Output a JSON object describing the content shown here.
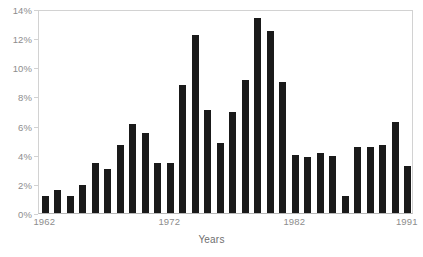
{
  "chart_data": {
    "type": "bar",
    "title": "",
    "subtitle": "",
    "xlabel": "Years",
    "ylabel": "",
    "categories": [
      "1962",
      "1963",
      "1964",
      "1965",
      "1966",
      "1967",
      "1968",
      "1969",
      "1970",
      "1971",
      "1972",
      "1973",
      "1974",
      "1975",
      "1976",
      "1977",
      "1978",
      "1979",
      "1980",
      "1981",
      "1982",
      "1983",
      "1984",
      "1985",
      "1986",
      "1987",
      "1988",
      "1989",
      "1990",
      "1991"
    ],
    "values": [
      1.2,
      1.6,
      1.2,
      1.9,
      3.4,
      3.0,
      4.7,
      6.1,
      5.5,
      3.4,
      3.4,
      8.8,
      12.25,
      7.1,
      4.8,
      6.9,
      9.1,
      13.4,
      12.5,
      9.0,
      4.0,
      3.85,
      4.1,
      3.9,
      1.2,
      4.5,
      4.5,
      4.7,
      6.25,
      3.2
    ],
    "ylim": [
      0,
      14
    ],
    "yticks": [
      0,
      2,
      4,
      6,
      8,
      10,
      12,
      14
    ],
    "ytick_labels": [
      "0%",
      "2%",
      "4%",
      "6%",
      "8%",
      "10%",
      "12%",
      "14%"
    ],
    "xtick_labels": [
      "1962",
      "1972",
      "1982",
      "1991"
    ],
    "xtick_indices": [
      0,
      10,
      20,
      29
    ],
    "grid": false,
    "legend": null,
    "bar_color": "#1a1a1a",
    "axis_color": "#d2d2d2",
    "tick_label_color": "#8d8d8d",
    "background_color": "#ffffff"
  }
}
